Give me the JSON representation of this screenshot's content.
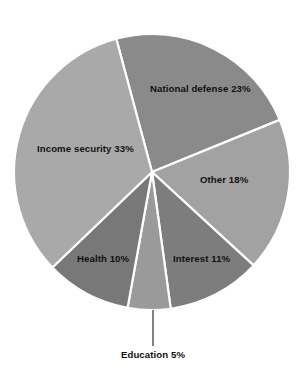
{
  "chart_data": {
    "type": "pie",
    "title": "",
    "subtitle": "",
    "xlabel": "",
    "ylabel": "",
    "legend_position": "none",
    "grid": false,
    "labels_inside": true,
    "categories": [
      "National defense",
      "Other",
      "Interest",
      "Education",
      "Health",
      "Income security"
    ],
    "values": [
      23,
      18,
      11,
      5,
      10,
      33
    ],
    "unit": "%",
    "slices": [
      {
        "name": "National defense",
        "value": 23,
        "label": "National defense 23%",
        "color": "#8a8a8a",
        "start_angle": 345,
        "end_angle": 427.8,
        "label_x": 150,
        "label_y": 92,
        "label_anchor": "start",
        "callout": false
      },
      {
        "name": "Other",
        "value": 18,
        "label": "Other 18%",
        "color": "#a2a2a2",
        "start_angle": 427.8,
        "end_angle": 492.6,
        "label_x": 200,
        "label_y": 183,
        "label_anchor": "start",
        "callout": false
      },
      {
        "name": "Interest",
        "value": 11,
        "label": "Interest 11%",
        "color": "#7d7d7d",
        "start_angle": 492.6,
        "end_angle": 532.2,
        "label_x": 173,
        "label_y": 262,
        "label_anchor": "start",
        "callout": false
      },
      {
        "name": "Education",
        "value": 5,
        "label": "Education 5%",
        "color": "#9a9a9a",
        "start_angle": 532.2,
        "end_angle": 550.2,
        "label_x": 153,
        "label_y": 358,
        "label_anchor": "middle",
        "callout": true,
        "leader_x1": 153,
        "leader_y1": 310,
        "leader_x2": 153,
        "leader_y2": 346
      },
      {
        "name": "Health",
        "value": 10,
        "label": "Health 10%",
        "color": "#787878",
        "start_angle": 550.2,
        "end_angle": 586.2,
        "label_x": 77,
        "label_y": 262,
        "label_anchor": "start",
        "callout": false
      },
      {
        "name": "Income security",
        "value": 33,
        "label": "Income security 33%",
        "color": "#a9a9a9",
        "start_angle": 586.2,
        "end_angle": 705,
        "label_x": 37,
        "label_y": 152,
        "label_anchor": "start",
        "callout": false
      }
    ],
    "geometry": {
      "center_x": 152,
      "center_y": 172,
      "radius": 138,
      "divider_color": "#ffffff",
      "background": "#ffffff"
    }
  }
}
